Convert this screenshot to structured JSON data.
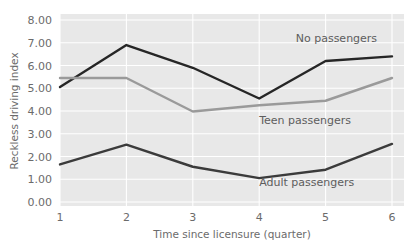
{
  "chart_data": {
    "type": "line",
    "title": "",
    "xlabel": "Time since licensure (quarter)",
    "ylabel": "Reckless driving index",
    "x": [
      1,
      2,
      3,
      4,
      5,
      6
    ],
    "xtick_labels": [
      "1",
      "2",
      "3",
      "4",
      "5",
      "6"
    ],
    "ytick_labels": [
      "0.00",
      "1.00",
      "2.00",
      "3.00",
      "4.00",
      "5.00",
      "6.00",
      "7.00",
      "8.00"
    ],
    "ytick_values": [
      0,
      1,
      2,
      3,
      4,
      5,
      6,
      7,
      8
    ],
    "xlim": [
      1,
      6
    ],
    "ylim": [
      0,
      8
    ],
    "grid": true,
    "grid_color": "#ffffff",
    "plot_background": "#e8e8e8",
    "legend_position": "inline-annotations",
    "series": [
      {
        "name": "No passengers",
        "label": "No passengers",
        "color": "#262626",
        "values": [
          5.05,
          6.9,
          5.9,
          4.55,
          6.2,
          6.4
        ],
        "label_x": 4.55,
        "label_y": 7.05
      },
      {
        "name": "Teen passengers",
        "label": "Teen passengers",
        "color": "#9a9a9a",
        "values": [
          5.45,
          5.45,
          3.98,
          4.25,
          4.45,
          5.45
        ],
        "label_x": 4.0,
        "label_y": 3.45
      },
      {
        "name": "Adult passengers",
        "label": "Adult passengers",
        "color": "#3b3b3b",
        "values": [
          1.65,
          2.52,
          1.55,
          1.05,
          1.42,
          2.55
        ],
        "label_x": 4.0,
        "label_y": 0.72
      }
    ]
  }
}
